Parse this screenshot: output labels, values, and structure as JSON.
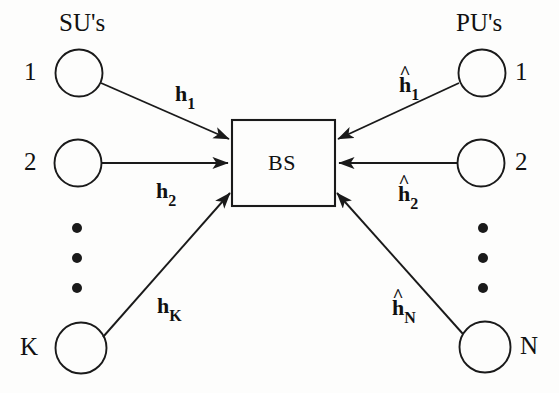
{
  "diagram": {
    "title_left": "SU's",
    "title_right": "PU's",
    "center": {
      "label": "BS",
      "shape": "rectangle"
    },
    "colors": {
      "stroke": "#1a1a1a",
      "background": "#fdfdfc",
      "text": "#111111"
    },
    "left_nodes": [
      {
        "index": "1",
        "shape": "circle"
      },
      {
        "index": "2",
        "shape": "circle"
      },
      {
        "index": "K",
        "shape": "circle"
      }
    ],
    "right_nodes": [
      {
        "index": "1",
        "shape": "circle"
      },
      {
        "index": "2",
        "shape": "circle"
      },
      {
        "index": "N",
        "shape": "circle"
      }
    ],
    "left_ellipsis": "vertical-dots",
    "right_ellipsis": "vertical-dots",
    "left_edges": [
      {
        "symbol": "h",
        "sub": "1",
        "hat": false,
        "direction": "to-bs"
      },
      {
        "symbol": "h",
        "sub": "2",
        "hat": false,
        "direction": "to-bs"
      },
      {
        "symbol": "h",
        "sub": "K",
        "hat": false,
        "direction": "to-bs"
      }
    ],
    "right_edges": [
      {
        "symbol": "h",
        "sub": "1",
        "hat": true,
        "hat_glyph": "^",
        "direction": "to-bs"
      },
      {
        "symbol": "h",
        "sub": "2",
        "hat": true,
        "hat_glyph": "^",
        "direction": "to-bs"
      },
      {
        "symbol": "h",
        "sub": "N",
        "hat": true,
        "hat_glyph": "^",
        "direction": "to-bs"
      }
    ]
  }
}
